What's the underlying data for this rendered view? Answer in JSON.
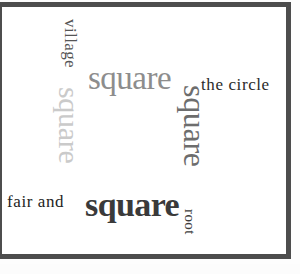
{
  "image": {
    "kind": "word-cloud",
    "width": 300,
    "height": 274,
    "background_color": "#ffffff",
    "frame_color": "#4d4d4d"
  },
  "words": [
    {
      "id": "village",
      "text": "village",
      "color": "#555555",
      "font_size_px": 17,
      "orientation": "vertical",
      "rotation_deg": 90,
      "weight": "normal",
      "x": 79,
      "y": 19
    },
    {
      "id": "square-top",
      "text": "square",
      "color": "#8d8d8d",
      "font_size_px": 33,
      "orientation": "horizontal",
      "rotation_deg": 0,
      "weight": "normal",
      "x": 88,
      "y": 62
    },
    {
      "id": "the-circle",
      "text": "the circle",
      "color": "#2b2b2b",
      "font_size_px": 17,
      "orientation": "horizontal",
      "rotation_deg": 0,
      "weight": "normal",
      "x": 201,
      "y": 76
    },
    {
      "id": "square-left",
      "text": "square",
      "color": "#cacaca",
      "font_size_px": 30,
      "orientation": "vertical",
      "rotation_deg": 90,
      "weight": "normal",
      "x": 84,
      "y": 87
    },
    {
      "id": "square-right",
      "text": "square",
      "color": "#6d6d6d",
      "font_size_px": 32,
      "orientation": "vertical",
      "rotation_deg": 90,
      "weight": "normal",
      "x": 211,
      "y": 85
    },
    {
      "id": "fair-and",
      "text": "fair and",
      "color": "#232323",
      "font_size_px": 17,
      "orientation": "horizontal",
      "rotation_deg": 0,
      "weight": "normal",
      "x": 7,
      "y": 193
    },
    {
      "id": "square-bottom",
      "text": "square",
      "color": "#3a3a3a",
      "font_size_px": 34,
      "orientation": "horizontal",
      "rotation_deg": 0,
      "weight": "bold",
      "x": 85,
      "y": 188
    },
    {
      "id": "root",
      "text": "root",
      "color": "#3d3d3d",
      "font_size_px": 15,
      "orientation": "vertical",
      "rotation_deg": 90,
      "weight": "normal",
      "x": 197,
      "y": 209
    }
  ]
}
